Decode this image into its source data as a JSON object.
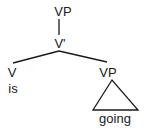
{
  "tree": {
    "root": {
      "label": "VP"
    },
    "vbar": {
      "label": "V'"
    },
    "left": {
      "label": "V",
      "word": "is"
    },
    "right": {
      "label": "VP",
      "word": "going",
      "abbreviated": true
    }
  },
  "colors": {
    "ink": "#1a1a1a",
    "background": "#ffffff"
  }
}
